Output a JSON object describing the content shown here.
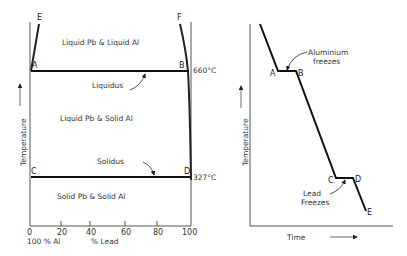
{
  "phase_diagram": {
    "regions": {
      "top": "Liquid Pb & Liquid Al",
      "middle": "Liquid Pb & Solid Al",
      "bottom": "Solid Pb & Solid Al"
    },
    "lines": {
      "liquidus": "Liquidus",
      "solidus": "Solidus"
    },
    "points": {
      "A": "A",
      "B": "B",
      "C": "C",
      "D": "D",
      "E": "E",
      "F": "F"
    },
    "temps": {
      "liquidus_temp": "660°C",
      "solidus_temp": "327°C"
    },
    "y_axis_label": "Temperature",
    "x_ticks": [
      "0",
      "20",
      "40",
      "60",
      "80",
      "100"
    ],
    "x_left_label": "100 % Al",
    "x_axis_label": "% Lead"
  },
  "cooling_curve": {
    "annotations": {
      "aluminium": [
        "Aluminium",
        "freezes"
      ],
      "lead": [
        "Lead",
        "Freezes"
      ]
    },
    "points": {
      "A": "A",
      "B": "B",
      "C": "C",
      "D": "D",
      "E": "E"
    },
    "y_axis_label": "Temperature",
    "x_axis_label": "Time"
  }
}
